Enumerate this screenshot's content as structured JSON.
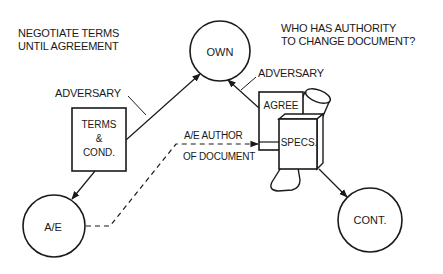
{
  "diagram": {
    "notes": {
      "left": [
        "NEGOTIATE TERMS",
        "UNTIL AGREEMENT"
      ],
      "right": [
        "WHO HAS AUTHORITY",
        "TO CHANGE DOCUMENT?"
      ]
    },
    "nodes": {
      "owner": "OWN",
      "ae": "A/E",
      "contractor": "CONT."
    },
    "documents": {
      "terms": [
        "TERMS",
        "&",
        "COND."
      ],
      "agree": "AGREE",
      "specs": "SPECS."
    },
    "edge_labels": {
      "adversary_left": "ADVERSARY",
      "adversary_right": "ADVERSARY",
      "ae_author": [
        "A/E AUTHOR",
        "OF DOCUMENT"
      ]
    },
    "colors": {
      "ink": "#1a1a1a",
      "background": "#ffffff"
    }
  }
}
